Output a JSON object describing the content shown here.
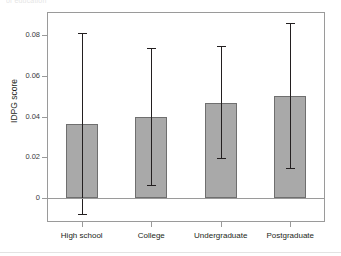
{
  "figure": {
    "top_fragment_text": "of education",
    "axis": {
      "y_title": "IDPG score",
      "y_title_main": "IDP",
      "y_title_sub": "G",
      "y_title_tail": " score",
      "y_ticks": [
        "0",
        "0.02",
        "0.04",
        "0.06",
        "0.08"
      ],
      "x_ticks": [
        "High school",
        "College",
        "Undergraduate",
        "Postgraduate"
      ]
    }
  },
  "chart_data": {
    "type": "bar",
    "title": "",
    "subtitle": "",
    "xlabel": "",
    "ylabel": "IDPG score",
    "ylim": [
      -0.012,
      0.09
    ],
    "yticks": [
      0,
      0.02,
      0.04,
      0.06,
      0.08
    ],
    "grid": false,
    "legend": "none",
    "error_bar_style": "capped-vertical",
    "categories": [
      "High school",
      "College",
      "Undergraduate",
      "Postgraduate"
    ],
    "values": [
      0.0365,
      0.04,
      0.0468,
      0.0503
    ],
    "error_low": [
      -0.0077,
      0.0065,
      0.0195,
      0.0145
    ],
    "error_high": [
      0.081,
      0.0735,
      0.0748,
      0.0857
    ],
    "series": [
      {
        "name": "IDPG score",
        "values": [
          0.0365,
          0.04,
          0.0468,
          0.0503
        ],
        "ci_lower": [
          -0.0077,
          0.0065,
          0.0195,
          0.0145
        ],
        "ci_upper": [
          0.081,
          0.0735,
          0.0748,
          0.0857
        ]
      }
    ],
    "colors": {
      "bar_fill": "#a9a9a9",
      "bar_stroke": "#6f6f6f",
      "error_bar": "#231f20",
      "axis": "#9a9a9a",
      "text": "#231f20"
    }
  }
}
